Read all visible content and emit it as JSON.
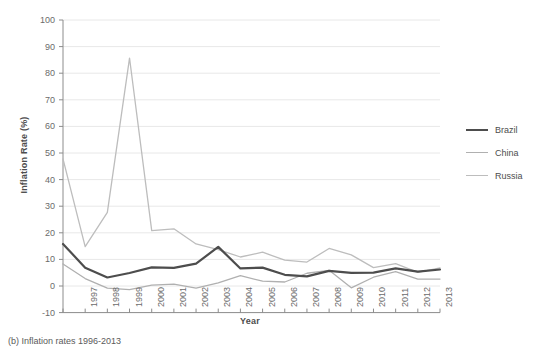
{
  "caption": "(b) Inflation rates 1996-2013",
  "chart_data": {
    "type": "line",
    "title": "",
    "xlabel": "Year",
    "ylabel": "Inflation Rate (%)",
    "x": [
      1996,
      1997,
      1998,
      1999,
      2000,
      2001,
      2002,
      2003,
      2004,
      2005,
      2006,
      2007,
      2008,
      2009,
      2010,
      2011,
      2012,
      2013
    ],
    "xtick_labels": [
      "",
      "1997",
      "1998",
      "1999",
      "2000",
      "2001",
      "2002",
      "2003",
      "2004",
      "2005",
      "2006",
      "2007",
      "2008",
      "2009",
      "2010",
      "2011",
      "2012",
      "2013"
    ],
    "ytick_labels": [
      "-10",
      "0",
      "10",
      "20",
      "30",
      "40",
      "50",
      "60",
      "70",
      "80",
      "90",
      "100"
    ],
    "ytick_values": [
      -10,
      0,
      10,
      20,
      30,
      40,
      50,
      60,
      70,
      80,
      90,
      100
    ],
    "xlim": [
      1996,
      2013
    ],
    "ylim": [
      -10,
      100
    ],
    "grid": "horizontal",
    "legend_position": "right",
    "series": [
      {
        "name": "Brazil",
        "color": "#4d4d4d",
        "width": 2.2,
        "values": [
          15.8,
          6.9,
          3.2,
          4.9,
          7.0,
          6.8,
          8.4,
          14.7,
          6.6,
          6.9,
          4.2,
          3.6,
          5.7,
          4.9,
          5.0,
          6.6,
          5.4,
          6.2
        ]
      },
      {
        "name": "China",
        "color": "#b0b0b0",
        "width": 1.3,
        "values": [
          8.3,
          2.8,
          -0.8,
          -1.4,
          0.3,
          0.7,
          -0.8,
          1.2,
          3.9,
          1.8,
          1.5,
          4.8,
          5.9,
          -0.7,
          3.3,
          5.4,
          2.6,
          2.6
        ]
      },
      {
        "name": "Russia",
        "color": "#bdbdbd",
        "width": 1.3,
        "values": [
          47.8,
          14.8,
          27.7,
          85.7,
          20.8,
          21.5,
          15.8,
          13.7,
          10.9,
          12.7,
          9.7,
          9.0,
          14.1,
          11.7,
          6.9,
          8.4,
          5.1,
          6.8
        ]
      }
    ]
  },
  "legend": {
    "items": [
      {
        "label": "Brazil"
      },
      {
        "label": "China"
      },
      {
        "label": "Russia"
      }
    ]
  },
  "colors": {
    "axis": "#8c8c8c",
    "grid": "#e8e8e8",
    "text": "#595959"
  }
}
